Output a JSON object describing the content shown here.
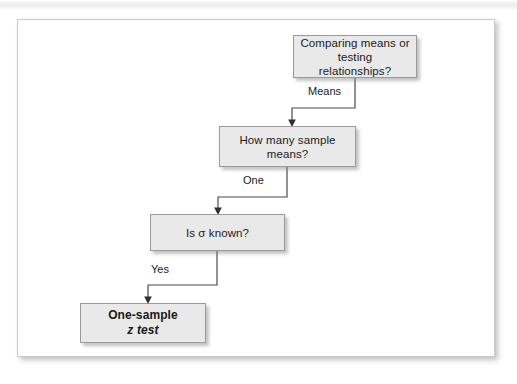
{
  "figure": {
    "type": "decision-flowchart",
    "background_color": "#ffffff",
    "panel_border_color": "#c9c9c9",
    "node_fill_color": "#e9e9e9",
    "node_border_color": "#9a9a9a",
    "connector_color": "#4b4b4b"
  },
  "nodes": [
    {
      "id": "question-comparing",
      "role": "decision",
      "lines": [
        "Comparing means or",
        "testing relationships?"
      ],
      "bold": false
    },
    {
      "id": "question-sample-means",
      "role": "decision",
      "lines": [
        "How many sample",
        "means?"
      ],
      "bold": false
    },
    {
      "id": "question-sigma-known",
      "role": "decision",
      "lines": [
        "Is σ known?"
      ],
      "bold": false
    },
    {
      "id": "result-one-sample-z",
      "role": "terminal",
      "lines": [
        "One-sample",
        "z test"
      ],
      "bold": true
    }
  ],
  "edges": [
    {
      "id": "edge-means",
      "from": "question-comparing",
      "to": "question-sample-means",
      "label": "Means"
    },
    {
      "id": "edge-one",
      "from": "question-sample-means",
      "to": "question-sigma-known",
      "label": "One"
    },
    {
      "id": "edge-yes",
      "from": "question-sigma-known",
      "to": "result-one-sample-z",
      "label": "Yes"
    }
  ]
}
